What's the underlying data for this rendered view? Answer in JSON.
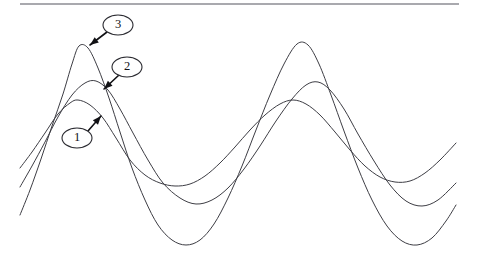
{
  "figure": {
    "background_color": "#ffffff",
    "curve_color": "#3d3d44",
    "rule_color": "#8d8d93",
    "callout_color": "#111115",
    "width": 477,
    "height": 262
  },
  "rule": {
    "name": "top-horizontal-rule",
    "x1": 20,
    "y1": 4,
    "x2": 459,
    "y2": 4
  },
  "callouts": [
    {
      "label": "1",
      "ellipse": {
        "cx": 77,
        "cy": 138,
        "rx": 15,
        "ry": 10
      },
      "leader": {
        "x1": 88,
        "y1": 131,
        "x2": 101,
        "y2": 116
      },
      "arrow_angle_deg": -49
    },
    {
      "label": "2",
      "ellipse": {
        "cx": 127,
        "cy": 67,
        "rx": 15,
        "ry": 10
      },
      "leader": {
        "x1": 119,
        "y1": 75,
        "x2": 104,
        "y2": 89
      },
      "arrow_angle_deg": 137
    },
    {
      "label": "3",
      "ellipse": {
        "cx": 118,
        "cy": 25,
        "rx": 15,
        "ry": 10
      },
      "leader": {
        "x1": 107,
        "y1": 32,
        "x2": 90,
        "y2": 45
      },
      "arrow_angle_deg": 142
    }
  ],
  "chart_data": {
    "type": "line",
    "title": "",
    "subtitle": "",
    "xlabel": "",
    "ylabel": "",
    "grid": false,
    "legend_position": "none",
    "x_range": [
      20,
      456
    ],
    "y_range_pixels": [
      43,
      245
    ],
    "annotations": [
      "1",
      "2",
      "3"
    ],
    "series": [
      {
        "name": "1",
        "amplitude_px": 43,
        "baseline_y": 143,
        "period_px": 215,
        "phase_px": 78,
        "points": [
          [
            20,
            168
          ],
          [
            32,
            152
          ],
          [
            45,
            133
          ],
          [
            58,
            114
          ],
          [
            70,
            103
          ],
          [
            78,
            100
          ],
          [
            90,
            105
          ],
          [
            103,
            118
          ],
          [
            116,
            138
          ],
          [
            130,
            160
          ],
          [
            145,
            175
          ],
          [
            160,
            183
          ],
          [
            175,
            186
          ],
          [
            190,
            184
          ],
          [
            205,
            176
          ],
          [
            220,
            163
          ],
          [
            235,
            147
          ],
          [
            250,
            130
          ],
          [
            265,
            115
          ],
          [
            280,
            104
          ],
          [
            293,
            100
          ],
          [
            306,
            104
          ],
          [
            320,
            115
          ],
          [
            335,
            132
          ],
          [
            350,
            150
          ],
          [
            365,
            166
          ],
          [
            380,
            177
          ],
          [
            395,
            182
          ],
          [
            410,
            181
          ],
          [
            425,
            173
          ],
          [
            440,
            160
          ],
          [
            456,
            143
          ]
        ]
      },
      {
        "name": "2",
        "amplitude_px": 62,
        "baseline_y": 145,
        "period_px": 222,
        "phase_px": 85,
        "points": [
          [
            20,
            187
          ],
          [
            32,
            166
          ],
          [
            45,
            142
          ],
          [
            58,
            117
          ],
          [
            72,
            95
          ],
          [
            85,
            83
          ],
          [
            96,
            81
          ],
          [
            108,
            90
          ],
          [
            120,
            109
          ],
          [
            133,
            133
          ],
          [
            148,
            160
          ],
          [
            163,
            183
          ],
          [
            180,
            198
          ],
          [
            196,
            204
          ],
          [
            212,
            200
          ],
          [
            228,
            188
          ],
          [
            244,
            169
          ],
          [
            260,
            146
          ],
          [
            276,
            121
          ],
          [
            292,
            99
          ],
          [
            306,
            85
          ],
          [
            318,
            82
          ],
          [
            330,
            90
          ],
          [
            344,
            109
          ],
          [
            358,
            134
          ],
          [
            374,
            161
          ],
          [
            390,
            185
          ],
          [
            406,
            201
          ],
          [
            422,
            206
          ],
          [
            438,
            200
          ],
          [
            456,
            183
          ]
        ]
      },
      {
        "name": "3",
        "amplitude_px": 100,
        "baseline_y": 144,
        "period_px": 220,
        "phase_px": 78,
        "points": [
          [
            20,
            215
          ],
          [
            30,
            190
          ],
          [
            41,
            159
          ],
          [
            52,
            126
          ],
          [
            63,
            94
          ],
          [
            72,
            64
          ],
          [
            79,
            46
          ],
          [
            88,
            48
          ],
          [
            98,
            68
          ],
          [
            109,
            98
          ],
          [
            120,
            132
          ],
          [
            132,
            168
          ],
          [
            145,
            200
          ],
          [
            158,
            225
          ],
          [
            172,
            240
          ],
          [
            186,
            245
          ],
          [
            200,
            240
          ],
          [
            214,
            224
          ],
          [
            228,
            198
          ],
          [
            242,
            166
          ],
          [
            256,
            130
          ],
          [
            270,
            95
          ],
          [
            284,
            64
          ],
          [
            297,
            44
          ],
          [
            308,
            45
          ],
          [
            319,
            64
          ],
          [
            331,
            95
          ],
          [
            344,
            131
          ],
          [
            358,
            168
          ],
          [
            372,
            200
          ],
          [
            387,
            226
          ],
          [
            402,
            241
          ],
          [
            417,
            245
          ],
          [
            432,
            238
          ],
          [
            446,
            221
          ],
          [
            456,
            205
          ]
        ]
      }
    ]
  }
}
